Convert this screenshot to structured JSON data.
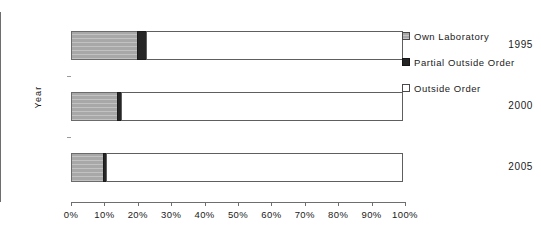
{
  "chart_data": {
    "type": "bar",
    "orientation": "horizontal",
    "stacked": true,
    "stack_mode": "percent",
    "title": "",
    "xlabel": "",
    "ylabel": "Year",
    "xlim": [
      0,
      100
    ],
    "grid": false,
    "legend_position": "right",
    "categories": [
      "1995",
      "2000",
      "2005"
    ],
    "x_tick_labels": [
      "0%",
      "10%",
      "20%",
      "30%",
      "40%",
      "50%",
      "60%",
      "70%",
      "80%",
      "90%",
      "100%"
    ],
    "x_tick_values": [
      0,
      10,
      20,
      30,
      40,
      50,
      60,
      70,
      80,
      90,
      100
    ],
    "series": [
      {
        "name": "Own Laboratory",
        "color": "#a8a8a8",
        "values": [
          20,
          14,
          10
        ]
      },
      {
        "name": "Partial Outside Order",
        "color": "#262626",
        "values": [
          3,
          1.5,
          1
        ]
      },
      {
        "name": "Outside Order",
        "color": "#ffffff",
        "values": [
          77,
          84.5,
          89
        ]
      }
    ]
  },
  "axes": {
    "y_title": "Year",
    "categories": [
      {
        "label": "1995"
      },
      {
        "label": "2000"
      },
      {
        "label": "2005"
      }
    ],
    "x_ticks": [
      {
        "label": "0%",
        "value": 0
      },
      {
        "label": "10%",
        "value": 10
      },
      {
        "label": "20%",
        "value": 20
      },
      {
        "label": "30%",
        "value": 30
      },
      {
        "label": "40%",
        "value": 40
      },
      {
        "label": "50%",
        "value": 50
      },
      {
        "label": "60%",
        "value": 60
      },
      {
        "label": "70%",
        "value": 70
      },
      {
        "label": "80%",
        "value": 80
      },
      {
        "label": "90%",
        "value": 90
      },
      {
        "label": "100%",
        "value": 100
      }
    ]
  },
  "legend": {
    "items": [
      {
        "label": "Own Laboratory",
        "swatch": "own-laboratory-swatch"
      },
      {
        "label": "Partial Outside Order",
        "swatch": "partial-outside-order-swatch"
      },
      {
        "label": "Outside Order",
        "swatch": "outside-order-swatch"
      }
    ]
  },
  "colors": {
    "own_laboratory": "#a8a8a8",
    "partial_outside_order": "#262626",
    "outside_order": "#ffffff",
    "axis": "#6e6e6e",
    "text": "#1a1a1a",
    "background": "#ffffff"
  }
}
